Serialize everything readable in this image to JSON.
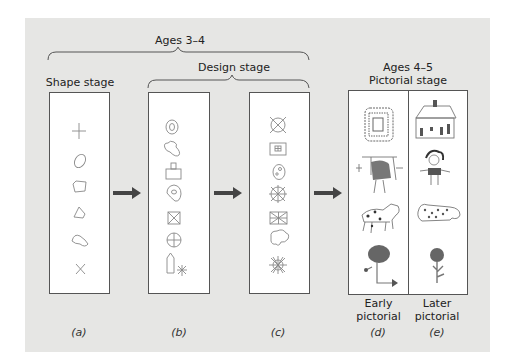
{
  "figure": {
    "group_label_ages_3_4": "Ages 3–4",
    "group_label_ages_4_5": "Ages 4–5",
    "stages": {
      "shape": "Shape stage",
      "design": "Design stage",
      "pictorial": "Pictorial stage"
    },
    "panels": [
      {
        "id": "a",
        "label": "(a)",
        "caption": "",
        "items": [
          "cross",
          "oval",
          "rectangle",
          "triangle",
          "odd shape",
          "x"
        ]
      },
      {
        "id": "b",
        "label": "(b)",
        "caption": "",
        "items": [
          "concentric oval",
          "combined blobs",
          "square with knob",
          "spiral blob",
          "boxed x",
          "circle with cross",
          "house shape",
          "star"
        ]
      },
      {
        "id": "c",
        "label": "(c)",
        "caption": "",
        "items": [
          "crossed circle",
          "box with square",
          "face circle",
          "radial wheel",
          "union-jack box",
          "cloud shape",
          "sun burst"
        ]
      },
      {
        "id": "d",
        "label": "(d)",
        "caption_line1": "Early",
        "caption_line2": "pictorial",
        "items": [
          "building",
          "person",
          "animal",
          "tree"
        ]
      },
      {
        "id": "e",
        "label": "(e)",
        "caption_line1": "Later",
        "caption_line2": "pictorial",
        "items": [
          "house",
          "person",
          "animal",
          "flower"
        ]
      }
    ],
    "colors": {
      "background": "#e6e6e4",
      "panel": "#ffffff",
      "stroke": "#555555",
      "arrow": "#444444",
      "drawing": "#888888"
    }
  }
}
